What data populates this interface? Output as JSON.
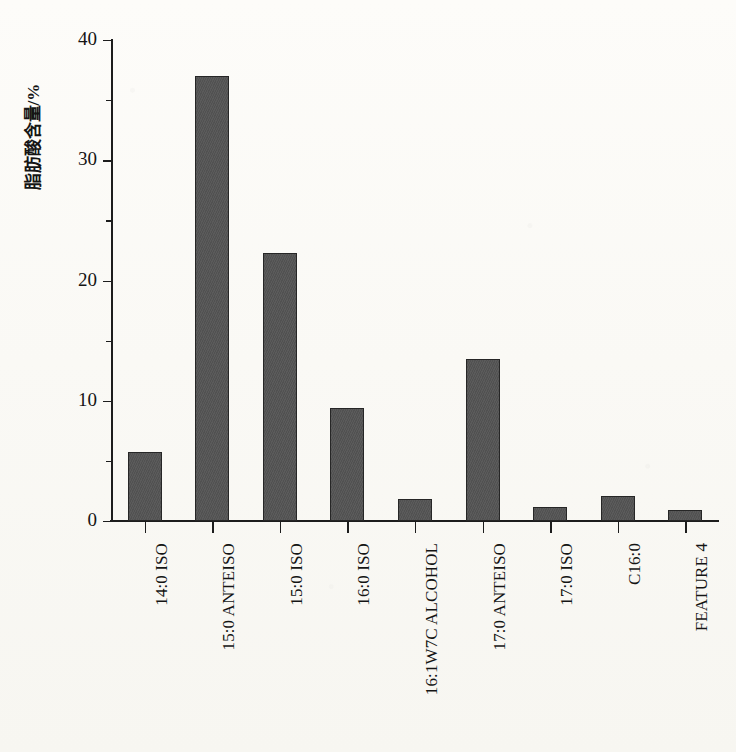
{
  "chart_data": {
    "type": "bar",
    "title": "",
    "xlabel": "",
    "ylabel": "脂肪酸含量/%",
    "ylim": [
      0,
      40
    ],
    "yticks": [
      0,
      10,
      20,
      30,
      40
    ],
    "grid": false,
    "legend": null,
    "bar_color": "#545454",
    "bar_edge_color": "#262626",
    "categories": [
      "14:0 ISO",
      "15:0 ANTEISO",
      "15:0 ISO",
      "16:0 ISO",
      "16:1W7C ALCOHOL",
      "17:0 ANTEISO",
      "17:0 ISO",
      "C16:0",
      "FEATURE 4"
    ],
    "values": [
      5.7,
      37.0,
      22.3,
      9.4,
      1.8,
      13.5,
      1.2,
      2.1,
      0.9
    ]
  },
  "axis": {
    "y_title": "脂肪酸含量/%",
    "y_tick_labels": [
      "40",
      "30",
      "20",
      "10",
      "0"
    ]
  }
}
